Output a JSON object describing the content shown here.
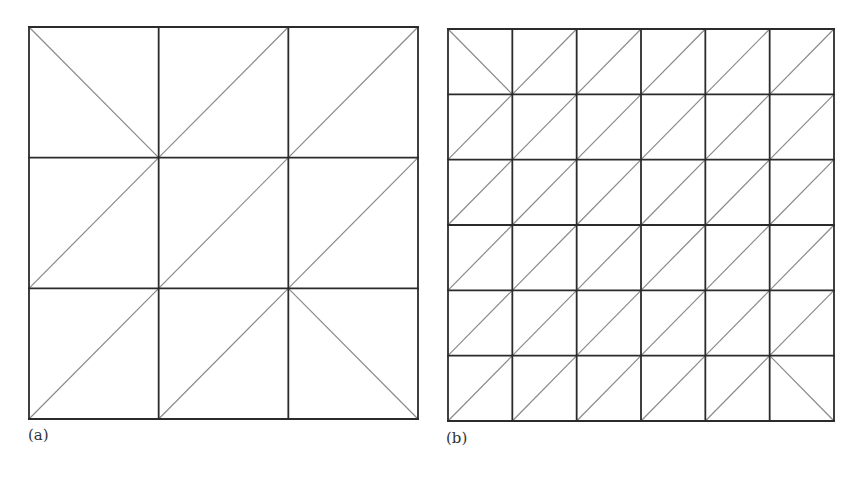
{
  "figure": {
    "panels": [
      {
        "id": "a",
        "label": "(a)",
        "grid_n": 3,
        "x0": 29,
        "y0": 27,
        "x1": 418,
        "y1": 419,
        "diagonal_default": "slash",
        "backslash_cells": [
          [
            0,
            0
          ],
          [
            2,
            2
          ]
        ],
        "label_pos": {
          "x": 28,
          "y": 426
        }
      },
      {
        "id": "b",
        "label": "(b)",
        "grid_n": 6,
        "x0": 448,
        "y0": 29,
        "x1": 834,
        "y1": 421,
        "diagonal_default": "slash",
        "backslash_cells": [
          [
            0,
            0
          ],
          [
            5,
            5
          ]
        ],
        "label_pos": {
          "x": 446,
          "y": 429
        }
      }
    ],
    "colors": {
      "grid_line": "#2b2b2b",
      "diagonal_line": "#8a8a8a",
      "background": "#ffffff"
    },
    "stroke": {
      "grid": 1.8,
      "diagonal": 1.2
    }
  }
}
